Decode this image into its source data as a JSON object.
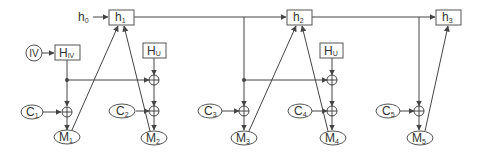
{
  "diagram": {
    "type": "block-diagram",
    "colors": {
      "stroke": "#444444",
      "box_border": "#555555",
      "text": "#333333",
      "background": "#ffffff"
    },
    "input": {
      "label": "h",
      "sub": "0"
    },
    "iv": {
      "label": "IV"
    },
    "hash_nodes": [
      {
        "id": "h1",
        "label": "h",
        "sub": "1"
      },
      {
        "id": "h2",
        "label": "h",
        "sub": "2"
      },
      {
        "id": "h3",
        "label": "h",
        "sub": "3"
      }
    ],
    "function_boxes": [
      {
        "id": "H_IV",
        "label": "H",
        "sub": "IV"
      },
      {
        "id": "H_U_1",
        "label": "H",
        "sub": "U"
      },
      {
        "id": "H_U_2",
        "label": "H",
        "sub": "U"
      }
    ],
    "counters": [
      {
        "id": "C1",
        "label": "C",
        "sub": "1"
      },
      {
        "id": "C2",
        "label": "C",
        "sub": "2"
      },
      {
        "id": "C3",
        "label": "C",
        "sub": "3"
      },
      {
        "id": "C4",
        "label": "C",
        "sub": "4"
      },
      {
        "id": "C5",
        "label": "C",
        "sub": "5"
      }
    ],
    "messages": [
      {
        "id": "M1",
        "label": "M",
        "sub": "1"
      },
      {
        "id": "M2",
        "label": "M",
        "sub": "2"
      },
      {
        "id": "M3",
        "label": "M",
        "sub": "3"
      },
      {
        "id": "M4",
        "label": "M",
        "sub": "4"
      },
      {
        "id": "M5",
        "label": "M",
        "sub": "5"
      }
    ],
    "operator": {
      "symbol": "xor-icon"
    }
  }
}
